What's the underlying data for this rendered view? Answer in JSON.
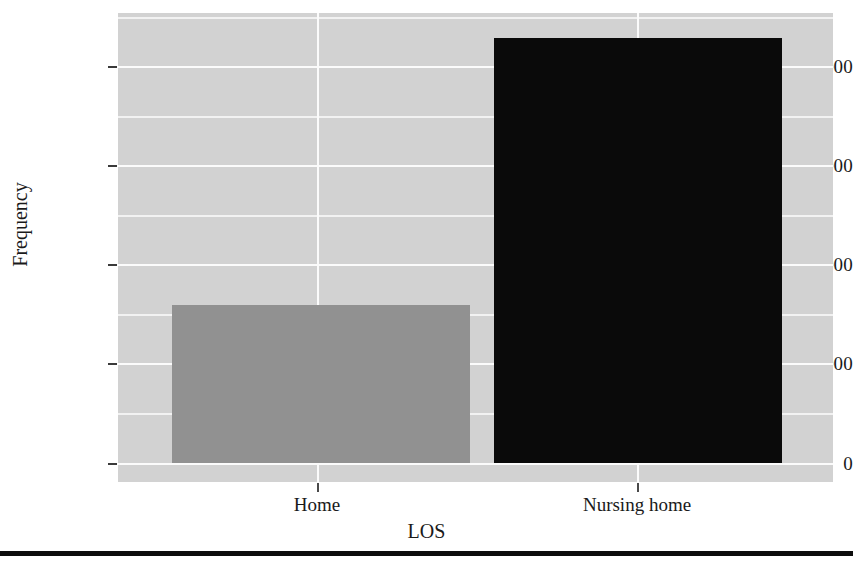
{
  "figure": {
    "background": "#ffffff",
    "panel_background": "#d2d2d2",
    "gridline_color": "#fbfbfb",
    "rule_color": "#0d0d0d"
  },
  "axes": {
    "ylabel": "Frequency",
    "xlabel": "LOS",
    "yticks": [
      "0",
      "5000",
      "10000",
      "15000",
      "20000"
    ],
    "xticks": [
      "Home",
      "Nursing home"
    ]
  },
  "chart_data": {
    "type": "bar",
    "title": "",
    "xlabel": "LOS",
    "ylabel": "Frequency",
    "categories": [
      "Home",
      "Nursing home"
    ],
    "values": [
      7960,
      21410
    ],
    "colors": [
      "#919191",
      "#0a0a0a"
    ],
    "ylim": [
      0,
      21800
    ],
    "ytick_values": [
      0,
      5000,
      10000,
      15000,
      20000
    ],
    "minor_ytick_values": [
      2500,
      7500,
      12500,
      17500
    ],
    "grid": true,
    "grid_color": "#ffffff",
    "legend": null,
    "series": [
      {
        "name": "Frequency",
        "values": [
          7960,
          21410
        ]
      }
    ]
  }
}
